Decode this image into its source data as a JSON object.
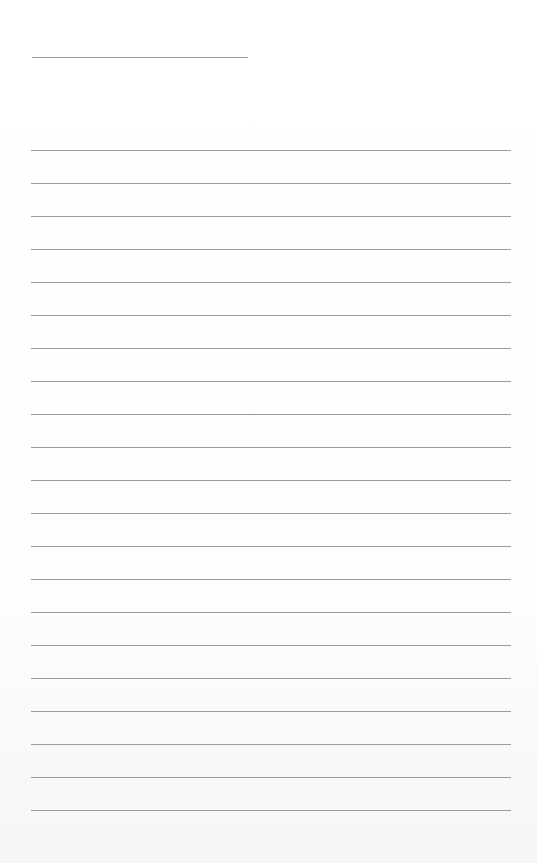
{
  "page": {
    "type": "lined-paper",
    "background_color": "#fdfdfd",
    "line_color": "#9c9c9c"
  },
  "title_line": {
    "x": 32,
    "y": 57,
    "width": 216
  },
  "ruled_lines": {
    "count": 21,
    "x": 31,
    "width": 480,
    "first_y": 150,
    "spacing": 33
  }
}
